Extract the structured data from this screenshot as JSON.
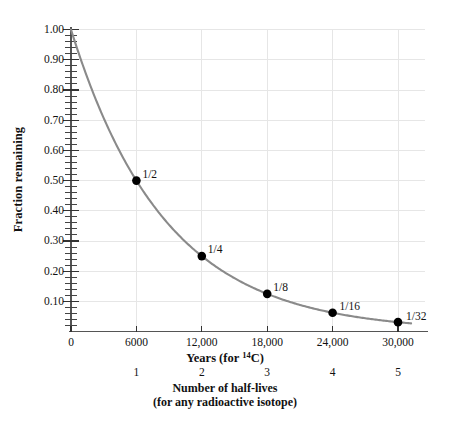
{
  "chart_data": {
    "type": "line",
    "title": "",
    "subtitle": "",
    "xlabel": "Years (for 14C)",
    "xlabel_prefix": "Years (for ",
    "xlabel_superscript": "14",
    "xlabel_suffix": "C)",
    "ylabel": "Fraction remaining",
    "secondary_xlabel_line1": "Number of half-lives",
    "secondary_xlabel_line2": "(for any radioactive isotope)",
    "xlim": [
      0,
      31500
    ],
    "ylim": [
      0,
      1.0
    ],
    "grid": true,
    "legend": "none",
    "curve_color": "#8a8a8a",
    "point_color": "#000000",
    "grid_color": "#e6e6e6",
    "axis_color": "#555555",
    "x_ticks": [
      0,
      6000,
      12000,
      18000,
      24000,
      30000
    ],
    "x_tick_labels": [
      "0",
      "6000",
      "12,000",
      "18,000",
      "24,000",
      "30,000"
    ],
    "y_ticks": [
      0.1,
      0.2,
      0.3,
      0.4,
      0.5,
      0.6,
      0.7,
      0.8,
      0.9,
      1.0
    ],
    "y_tick_labels": [
      "0.10",
      "0.20",
      "0.30",
      "0.40",
      "0.50",
      "0.60",
      "0.70",
      "0.80",
      "0.90",
      "1.00"
    ],
    "y_minor_tick_step": 0.02,
    "secondary_x_ticks": [
      6000,
      12000,
      18000,
      24000,
      30000
    ],
    "secondary_x_tick_labels": [
      "1",
      "2",
      "3",
      "4",
      "5"
    ],
    "half_life_years": 6000,
    "series": [
      {
        "name": "Fraction remaining",
        "x": [
          0,
          6000,
          12000,
          18000,
          24000,
          30000
        ],
        "values": [
          1.0,
          0.5,
          0.25,
          0.125,
          0.0625,
          0.03125
        ]
      }
    ],
    "points": [
      {
        "x": 6000,
        "y": 0.5,
        "label": "1/2"
      },
      {
        "x": 12000,
        "y": 0.25,
        "label": "1/4"
      },
      {
        "x": 18000,
        "y": 0.125,
        "label": "1/8"
      },
      {
        "x": 24000,
        "y": 0.0625,
        "label": "1/16"
      },
      {
        "x": 30000,
        "y": 0.03125,
        "label": "1/32"
      }
    ]
  }
}
